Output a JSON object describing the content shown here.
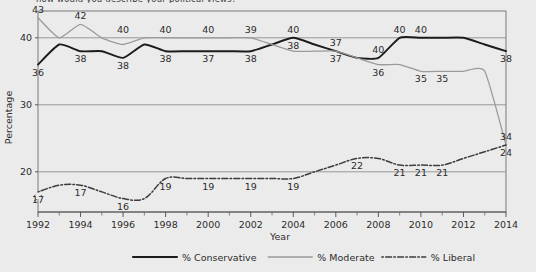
{
  "figure": {
    "top_caption_partial": "now would you describe your political views?",
    "background_color": "#ebebeb",
    "plot_border_color": "#6e6e6e"
  },
  "axes": {
    "y_title": "Percentage",
    "y_ticks": [
      20,
      30,
      40
    ],
    "y_tick_labels": [
      "20",
      "30",
      "40"
    ],
    "y_axis_break": true,
    "x_title": "Year",
    "x_tick_labels": [
      "1992",
      "1994",
      "1996",
      "1998",
      "2000",
      "2002",
      "2004",
      "2006",
      "2008",
      "2010",
      "2012",
      "2014"
    ],
    "x_minor_tick_years": [
      1993,
      1995,
      1997,
      1999,
      2001,
      2003,
      2005,
      2007,
      2009,
      2011,
      2013
    ]
  },
  "legend": {
    "items": [
      {
        "label": "% Conservative",
        "color": "#1c1c1c",
        "style": "solid"
      },
      {
        "label": "% Moderate",
        "color": "#9a9a9a",
        "style": "solid"
      },
      {
        "label": "% Liberal",
        "color": "#3c3c3c",
        "style": "dashdot"
      }
    ]
  },
  "chart_data": {
    "type": "line",
    "title": "",
    "xlabel": "Year",
    "ylabel": "Percentage",
    "xlim": [
      1992,
      2014
    ],
    "ylim": [
      14,
      44
    ],
    "grid": "horizontal",
    "legend_position": "bottom",
    "x": [
      1992,
      1993,
      1994,
      1995,
      1996,
      1997,
      1998,
      1999,
      2000,
      2001,
      2002,
      2003,
      2004,
      2005,
      2006,
      2007,
      2008,
      2009,
      2010,
      2011,
      2012,
      2013,
      2014
    ],
    "series": [
      {
        "name": "% Conservative",
        "color": "#1c1c1c",
        "style": "solid",
        "values": [
          36,
          39,
          38,
          38,
          37,
          39,
          38,
          38,
          38,
          38,
          38,
          39,
          40,
          39,
          38,
          37,
          37,
          40,
          40,
          40,
          40,
          39,
          38
        ],
        "labels": [
          {
            "year": 1992,
            "value": 36,
            "text": "36",
            "pos": "below"
          },
          {
            "year": 1994,
            "value": 38,
            "text": "38",
            "pos": "below"
          },
          {
            "year": 1996,
            "value": 37,
            "text": "38",
            "pos": "below"
          },
          {
            "year": 1998,
            "value": 38,
            "text": "38",
            "pos": "below"
          },
          {
            "year": 2000,
            "value": 38,
            "text": "37",
            "pos": "below"
          },
          {
            "year": 2002,
            "value": 38,
            "text": "38",
            "pos": "below"
          },
          {
            "year": 2004,
            "value": 40,
            "text": "38",
            "pos": "below"
          },
          {
            "year": 2006,
            "value": 38,
            "text": "37",
            "pos": "above"
          },
          {
            "year": 2008,
            "value": 37,
            "text": "40",
            "pos": "above"
          },
          {
            "year": 2009,
            "value": 40,
            "text": "40",
            "pos": "above"
          },
          {
            "year": 2010,
            "value": 40,
            "text": "40",
            "pos": "above"
          },
          {
            "year": 2014,
            "value": 38,
            "text": "38",
            "pos": "below"
          }
        ]
      },
      {
        "name": "% Moderate",
        "color": "#9a9a9a",
        "style": "solid",
        "values": [
          43,
          40,
          42,
          40,
          39,
          40,
          40,
          40,
          40,
          40,
          40,
          39,
          38,
          38,
          38,
          37,
          36,
          36,
          35,
          35,
          35,
          35,
          24
        ],
        "labels": [
          {
            "year": 1992,
            "value": 43,
            "text": "43",
            "pos": "above"
          },
          {
            "year": 1994,
            "value": 42,
            "text": "42",
            "pos": "above"
          },
          {
            "year": 1996,
            "value": 40,
            "text": "40",
            "pos": "above"
          },
          {
            "year": 1998,
            "value": 40,
            "text": "40",
            "pos": "above"
          },
          {
            "year": 2000,
            "value": 40,
            "text": "40",
            "pos": "above"
          },
          {
            "year": 2002,
            "value": 40,
            "text": "39",
            "pos": "above"
          },
          {
            "year": 2004,
            "value": 40,
            "text": "40",
            "pos": "above"
          },
          {
            "year": 2006,
            "value": 38,
            "text": "37",
            "pos": "below"
          },
          {
            "year": 2008,
            "value": 36,
            "text": "36",
            "pos": "below"
          },
          {
            "year": 2010,
            "value": 35,
            "text": "35",
            "pos": "below"
          },
          {
            "year": 2011,
            "value": 35,
            "text": "35",
            "pos": "below"
          },
          {
            "year": 2014,
            "value": 24,
            "text": "24",
            "pos": "below"
          }
        ]
      },
      {
        "name": "% Liberal",
        "color": "#3c3c3c",
        "style": "dashdot",
        "values": [
          17,
          18,
          18,
          17,
          16,
          16,
          19,
          19,
          19,
          19,
          19,
          19,
          19,
          20,
          21,
          22,
          22,
          21,
          21,
          21,
          22,
          23,
          24
        ],
        "labels": [
          {
            "year": 1992,
            "value": 17,
            "text": "17",
            "pos": "below"
          },
          {
            "year": 1994,
            "value": 18,
            "text": "17",
            "pos": "below"
          },
          {
            "year": 1996,
            "value": 16,
            "text": "16",
            "pos": "below"
          },
          {
            "year": 1998,
            "value": 19,
            "text": "19",
            "pos": "below"
          },
          {
            "year": 2000,
            "value": 19,
            "text": "19",
            "pos": "below"
          },
          {
            "year": 2002,
            "value": 19,
            "text": "19",
            "pos": "below"
          },
          {
            "year": 2004,
            "value": 19,
            "text": "19",
            "pos": "below"
          },
          {
            "year": 2007,
            "value": 22,
            "text": "22",
            "pos": "below"
          },
          {
            "year": 2009,
            "value": 21,
            "text": "21",
            "pos": "below"
          },
          {
            "year": 2010,
            "value": 21,
            "text": "21",
            "pos": "below"
          },
          {
            "year": 2011,
            "value": 21,
            "text": "21",
            "pos": "below"
          },
          {
            "year": 2014,
            "value": 24,
            "text": "34",
            "pos": "above"
          }
        ]
      }
    ]
  }
}
